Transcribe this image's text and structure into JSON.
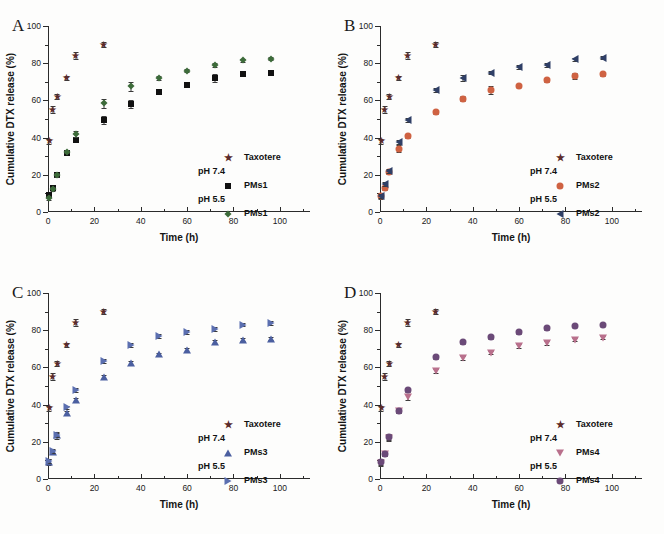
{
  "figure": {
    "panels": [
      {
        "letter": "A",
        "xlabel": "Time (h)",
        "ylabel": "Cumulative DTX release (%)",
        "legend": {
          "taxotere_label": "Taxotere",
          "ph74_label": "pH 7.4",
          "ph74_series": "PMs1",
          "ph55_label": "pH 5.5",
          "ph55_series": "PMs1"
        }
      },
      {
        "letter": "B",
        "xlabel": "Time (h)",
        "ylabel": "Cumulative DTX release (%)",
        "legend": {
          "taxotere_label": "Taxotere",
          "ph74_label": "pH 7.4",
          "ph74_series": "PMs2",
          "ph55_label": "pH 5.5",
          "ph55_series": "PMs2"
        }
      },
      {
        "letter": "C",
        "xlabel": "Time (h)",
        "ylabel": "Cumulative DTX release (%)",
        "legend": {
          "taxotere_label": "Taxotere",
          "ph74_label": "pH 7.4",
          "ph74_series": "PMs3",
          "ph55_label": "pH 5.5",
          "ph55_series": "PMs3"
        }
      },
      {
        "letter": "D",
        "xlabel": "Time (h)",
        "ylabel": "Cumulative DTX release (%)",
        "legend": {
          "taxotere_label": "Taxotere",
          "ph74_label": "pH 7.4",
          "ph74_series": "PMs4",
          "ph55_label": "pH 5.5",
          "ph55_series": "PMs4"
        }
      }
    ]
  },
  "axes": {
    "xticks": [
      0,
      20,
      40,
      60,
      80,
      100
    ],
    "xminor": [
      10,
      30,
      50,
      70,
      90,
      110
    ],
    "yticks": [
      0,
      20,
      40,
      60,
      80,
      100
    ],
    "yminor": [
      10,
      30,
      50,
      70,
      90
    ],
    "xlim": [
      0,
      113
    ],
    "ylim": [
      0,
      100
    ]
  },
  "colors": {
    "taxotere": "#5c2b2b",
    "pms1_ph74": "#111111",
    "pms1_ph55": "#3d6b3a",
    "pms2_ph74": "#cf6242",
    "pms2_ph55": "#2f3f66",
    "pms3_ph74": "#4b5fa0",
    "pms3_ph55": "#5b6fb0",
    "pms4_ph74": "#b9708c",
    "pms4_ph55": "#6b4a78",
    "axis": "#2b2b2b",
    "background": "#fdfdfc"
  },
  "chart_data": [
    {
      "type": "scatter",
      "panel": "A",
      "title": "A",
      "xlabel": "Time (h)",
      "ylabel": "Cumulative DTX release (%)",
      "xlim": [
        0,
        113
      ],
      "ylim": [
        0,
        100
      ],
      "grid": false,
      "legend_position": "lower-right",
      "series": [
        {
          "name": "Taxotere",
          "marker": "star",
          "color": "#5c2b2b",
          "x": [
            0.5,
            2,
            4,
            8,
            12,
            24
          ],
          "values": [
            38,
            55,
            62,
            72,
            84,
            90
          ],
          "errors": [
            1.5,
            2,
            1.5,
            1,
            2,
            1.5
          ]
        },
        {
          "name": "PMs1 pH 7.4",
          "marker": "square",
          "color": "#111111",
          "x": [
            0.5,
            2,
            4,
            8,
            12,
            24,
            36,
            48,
            60,
            72,
            84,
            96
          ],
          "values": [
            9,
            13,
            20,
            31.5,
            38.5,
            49.5,
            58,
            64.5,
            68.5,
            72,
            74,
            74.5
          ],
          "errors": [
            1.5,
            1,
            1,
            1,
            1,
            2,
            2,
            1,
            1,
            2,
            1,
            1
          ]
        },
        {
          "name": "PMs1 pH 5.5",
          "marker": "diamond",
          "color": "#3d6b3a",
          "x": [
            0.5,
            2,
            4,
            8,
            12,
            24,
            36,
            48,
            60,
            72,
            84,
            96
          ],
          "values": [
            7.5,
            12.5,
            20,
            32.5,
            42,
            58.5,
            67.5,
            72,
            76,
            79,
            81.5,
            82.5
          ],
          "errors": [
            1,
            1,
            1,
            1,
            1.5,
            2.5,
            2.5,
            1,
            1,
            1,
            1,
            1
          ]
        }
      ]
    },
    {
      "type": "scatter",
      "panel": "B",
      "title": "B",
      "xlabel": "Time (h)",
      "ylabel": "Cumulative DTX release (%)",
      "xlim": [
        0,
        113
      ],
      "ylim": [
        0,
        100
      ],
      "grid": false,
      "legend_position": "lower-right",
      "series": [
        {
          "name": "Taxotere",
          "marker": "star",
          "color": "#5c2b2b",
          "x": [
            0.5,
            2,
            4,
            8,
            12,
            24
          ],
          "values": [
            38,
            55,
            62,
            72,
            84,
            90
          ],
          "errors": [
            1.5,
            2,
            1.5,
            1,
            2,
            1.5
          ]
        },
        {
          "name": "PMs2 pH 7.4",
          "marker": "circle",
          "color": "#cf6242",
          "x": [
            0.5,
            2,
            4,
            8,
            12,
            24,
            36,
            48,
            60,
            72,
            84,
            96
          ],
          "values": [
            8.5,
            13,
            21.5,
            34,
            41,
            53.5,
            61,
            65.5,
            68,
            71,
            73,
            74
          ],
          "errors": [
            1.5,
            1,
            1,
            2,
            1,
            1,
            1.5,
            2,
            1,
            1,
            1.5,
            1
          ]
        },
        {
          "name": "PMs2 pH 5.5",
          "marker": "triangle-left",
          "color": "#2f3f66",
          "x": [
            0.5,
            2,
            4,
            8,
            12,
            24,
            36,
            48,
            60,
            72,
            84,
            96
          ],
          "values": [
            8.5,
            15,
            22,
            37.5,
            49.5,
            65.5,
            72,
            75,
            78,
            79,
            82,
            83
          ],
          "errors": [
            1,
            1,
            1,
            1,
            1,
            1,
            1.5,
            1,
            1,
            1,
            1,
            1
          ]
        }
      ]
    },
    {
      "type": "scatter",
      "panel": "C",
      "title": "C",
      "xlabel": "Time (h)",
      "ylabel": "Cumulative DTX release (%)",
      "xlim": [
        0,
        113
      ],
      "ylim": [
        0,
        100
      ],
      "grid": false,
      "legend_position": "lower-right",
      "series": [
        {
          "name": "Taxotere",
          "marker": "star",
          "color": "#5c2b2b",
          "x": [
            0.5,
            2,
            4,
            8,
            12,
            24
          ],
          "values": [
            38,
            55,
            62,
            72,
            84,
            90
          ],
          "errors": [
            1.5,
            2,
            1.5,
            1,
            2,
            1.5
          ]
        },
        {
          "name": "PMs3 pH 7.4",
          "marker": "triangle-up",
          "color": "#4b5fa0",
          "x": [
            0.5,
            2,
            4,
            8,
            12,
            24,
            36,
            48,
            60,
            72,
            84,
            96
          ],
          "values": [
            9,
            14.5,
            23.5,
            35.5,
            42.5,
            55,
            62.5,
            67,
            69.5,
            73.5,
            75,
            75.5
          ],
          "errors": [
            1.5,
            1,
            2,
            1,
            1,
            1,
            1,
            1,
            1,
            1,
            1,
            1
          ]
        },
        {
          "name": "PMs3 pH 5.5",
          "marker": "triangle-right",
          "color": "#5b6fb0",
          "x": [
            0.5,
            2,
            4,
            8,
            12,
            24,
            36,
            48,
            60,
            72,
            84,
            96
          ],
          "values": [
            9.5,
            15,
            23.5,
            38.5,
            48,
            63.5,
            72,
            77,
            79,
            80.5,
            83,
            84
          ],
          "errors": [
            1,
            1,
            1,
            1,
            1,
            1,
            1,
            1,
            1,
            1,
            1,
            1
          ]
        }
      ]
    },
    {
      "type": "scatter",
      "panel": "D",
      "title": "D",
      "xlabel": "Time (h)",
      "ylabel": "Cumulative DTX release (%)",
      "xlim": [
        0,
        113
      ],
      "ylim": [
        0,
        100
      ],
      "grid": false,
      "legend_position": "lower-right",
      "series": [
        {
          "name": "Taxotere",
          "marker": "star",
          "color": "#5c2b2b",
          "x": [
            0.5,
            2,
            4,
            8,
            12,
            24
          ],
          "values": [
            38,
            55,
            62,
            72,
            84,
            90
          ],
          "errors": [
            1.5,
            2,
            1.5,
            1,
            2,
            1.5
          ]
        },
        {
          "name": "PMs4 pH 7.4",
          "marker": "triangle-down",
          "color": "#b9708c",
          "x": [
            0.5,
            2,
            4,
            8,
            12,
            24,
            36,
            48,
            60,
            72,
            84,
            96
          ],
          "values": [
            8.5,
            13.5,
            22,
            36.5,
            44,
            58,
            65,
            68,
            71.5,
            73,
            75,
            76
          ],
          "errors": [
            1.5,
            1,
            1.5,
            1,
            1.5,
            1,
            1,
            1,
            1,
            1,
            1,
            1
          ]
        },
        {
          "name": "PMs4 pH 5.5",
          "marker": "circle",
          "color": "#6b4a78",
          "x": [
            0.5,
            2,
            4,
            8,
            12,
            24,
            36,
            48,
            60,
            72,
            84,
            96
          ],
          "values": [
            9,
            13.5,
            22.5,
            36.5,
            48,
            65.5,
            73.5,
            76.5,
            79,
            81,
            82.5,
            83
          ],
          "errors": [
            1.5,
            1,
            1.5,
            1,
            1,
            1,
            1,
            1,
            1,
            1,
            1,
            1
          ]
        }
      ]
    }
  ]
}
